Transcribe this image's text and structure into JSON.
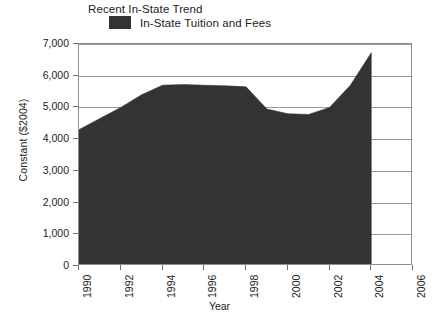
{
  "chart_data": {
    "type": "area",
    "title": "Recent In-State Trend",
    "xlabel": "Year",
    "ylabel": "Constant ($2004)",
    "legend": [
      {
        "name": "In-State Tuition and Fees",
        "color": "#333333"
      }
    ],
    "legend_position": "top-left",
    "grid": true,
    "xlim": [
      1990,
      2006
    ],
    "ylim": [
      0,
      7000
    ],
    "ytick_values": [
      0,
      1000,
      2000,
      3000,
      4000,
      5000,
      6000,
      7000
    ],
    "ytick_labels": [
      "0",
      "1,000",
      "2,000",
      "3,000",
      "4,000",
      "5,000",
      "6,000",
      "7,000"
    ],
    "xtick_values": [
      1990,
      1992,
      1994,
      1996,
      1998,
      2000,
      2002,
      2004,
      2006
    ],
    "xtick_labels": [
      "1990",
      "1992",
      "1994",
      "1996",
      "1998",
      "2000",
      "2002",
      "2004",
      "2006"
    ],
    "x": [
      1990,
      1991,
      1992,
      1993,
      1994,
      1995,
      1996,
      1997,
      1998,
      1999,
      2000,
      2001,
      2002,
      2003,
      2004
    ],
    "series": [
      {
        "name": "In-State Tuition and Fees",
        "color": "#333333",
        "values": [
          4300,
          4650,
          5000,
          5400,
          5700,
          5720,
          5700,
          5680,
          5650,
          4950,
          4800,
          4780,
          5000,
          5700,
          6725
        ]
      }
    ]
  },
  "colors": {
    "series_fill": "#333333",
    "axis_line": "#8d8d8d",
    "gridline": "#9a9a9a",
    "text": "#222222",
    "background": "#ffffff"
  }
}
